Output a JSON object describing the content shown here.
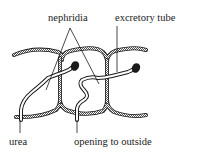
{
  "diagram": {
    "labels": {
      "nephridia": "nephridia",
      "excretory_tube": "excretory tube",
      "urea": "urea",
      "opening": "opening to outside"
    },
    "colors": {
      "line": "#1a1a1a",
      "wall_fill": "#9a9a9a",
      "background": "#ffffff"
    }
  }
}
